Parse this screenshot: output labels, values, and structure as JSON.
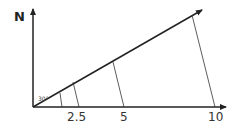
{
  "diagram": {
    "axis_label_north": "N",
    "angle_label": "30°",
    "ticks": [
      "2.5",
      "5",
      "10"
    ],
    "colors": {
      "line": "#222222",
      "background": "#ffffff"
    }
  }
}
